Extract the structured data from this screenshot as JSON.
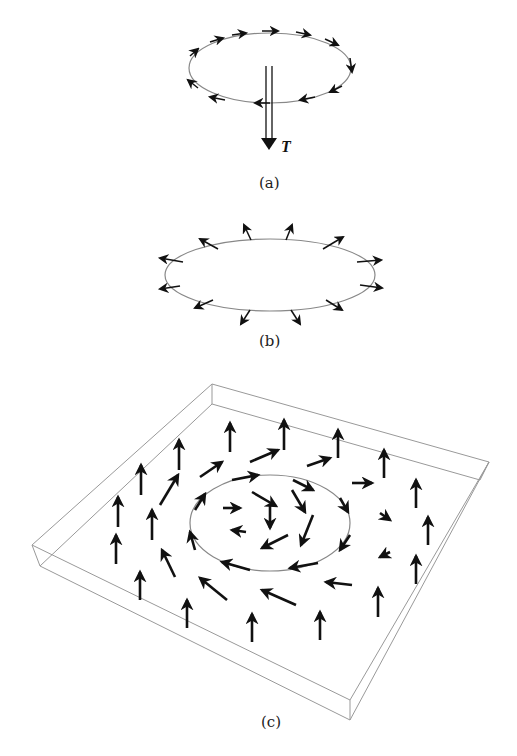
{
  "figure": {
    "panels": [
      {
        "id": "a",
        "caption": "(a)",
        "description": "Ring with tangential circulating arrows and vertical double arrow labeled T",
        "arrow_label": "T"
      },
      {
        "id": "b",
        "caption": "(b)",
        "description": "Ring with radially outward pointing arrows"
      },
      {
        "id": "c",
        "caption": "(c)",
        "description": "3D box slab with vector field of arrows forming a vortex around a central ring"
      }
    ]
  },
  "colors": {
    "line": "#888888",
    "arrow": "#111111",
    "background": "#ffffff"
  }
}
